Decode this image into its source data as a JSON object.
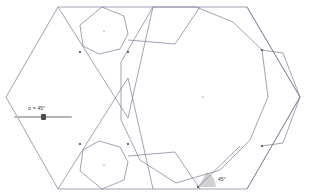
{
  "app": {
    "title": "Dynamic geometry construction",
    "background": "#ffffff"
  },
  "slider": {
    "name": "alpha-slider",
    "label": "α = 45°",
    "variable": "α",
    "value": 45,
    "unit": "°",
    "min": 0,
    "max": 90,
    "track_color": "#b4b4b4",
    "handle_color": "#4d4d4d"
  },
  "annotations": {
    "angle_label": "45°",
    "angle_fill": "#c8c8c8"
  },
  "figure": {
    "stroke": "#6e6e8c",
    "stroke_light": "#9a9ab0",
    "point_color": "#4a4a4a",
    "outer_hexagon": {
      "name": "outer-hexagon",
      "points": "58,7 247,7 300,97 247,189 58,189 6,97"
    },
    "central_polygon": {
      "name": "central-polygon",
      "points": "153,7 196,7 233,22 262,50 268,97 250,140 220,170 176,183 140,160 121,120 121,62"
    },
    "chevrons": [
      {
        "name": "chevron-upper-left",
        "d": "M58,7 L128,118 L153,7"
      },
      {
        "name": "chevron-lower-left",
        "d": "M58,189 L128,78 L153,189"
      },
      {
        "name": "chevron-upper-right",
        "d": "M247,7 L300,97 L247,189"
      }
    ],
    "small_polygons": [
      {
        "name": "small-polygon-top",
        "points": "102,7 124,16 128,34 120,49 99,54 83,46 80,25"
      },
      {
        "name": "small-polygon-bottom",
        "points": "83,150 99,141 120,147 128,162 124,180 102,189 80,171"
      }
    ],
    "inner_edges": [
      {
        "name": "edge-upper-diagonal",
        "d": "M128,40 L175,44 L200,7"
      },
      {
        "name": "edge-lower-diagonal",
        "d": "M128,156 L175,152 L200,189"
      },
      {
        "name": "edge-right-upper",
        "d": "M262,50 L283,53 L300,97"
      },
      {
        "name": "edge-right-lower",
        "d": "M262,146 L283,143 L300,97"
      }
    ],
    "centers": [
      {
        "name": "center-point-main",
        "cx": 203,
        "cy": 97
      },
      {
        "name": "center-point-top",
        "cx": 104,
        "cy": 31
      },
      {
        "name": "center-point-bottom",
        "cx": 104,
        "cy": 165
      }
    ],
    "vertices": [
      {
        "name": "vertex-a",
        "cx": 80,
        "cy": 52
      },
      {
        "name": "vertex-b",
        "cx": 128,
        "cy": 52
      },
      {
        "name": "vertex-c",
        "cx": 80,
        "cy": 144
      },
      {
        "name": "vertex-d",
        "cx": 128,
        "cy": 144
      },
      {
        "name": "vertex-e",
        "cx": 262,
        "cy": 50
      },
      {
        "name": "vertex-f",
        "cx": 262,
        "cy": 146
      },
      {
        "name": "vertex-g",
        "cx": 198,
        "cy": 187
      }
    ]
  }
}
